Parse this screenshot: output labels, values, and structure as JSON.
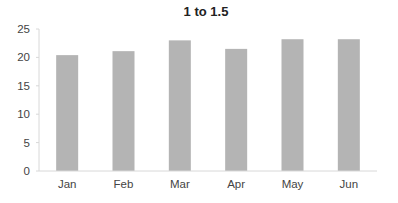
{
  "chart_data": {
    "type": "bar",
    "title": "1 to 1.5",
    "xlabel": "",
    "ylabel": "",
    "categories": [
      "Jan",
      "Feb",
      "Mar",
      "Apr",
      "May",
      "Jun"
    ],
    "values": [
      20.4,
      21.1,
      23.0,
      21.5,
      23.2,
      23.2
    ],
    "ylim": [
      0,
      25
    ],
    "yticks": [
      0,
      5,
      10,
      15,
      20,
      25
    ],
    "grid": false,
    "legend": null,
    "bar_color": "#b4b4b4"
  }
}
